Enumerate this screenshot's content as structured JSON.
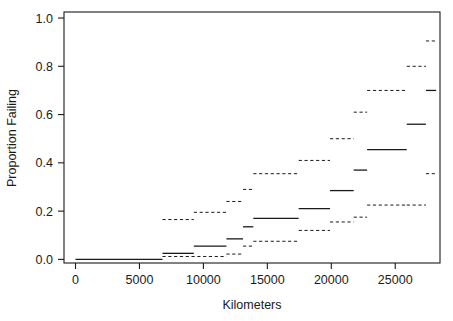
{
  "chart_data": {
    "type": "line",
    "title": "",
    "subtitle": "",
    "xlabel": "Kilometers",
    "ylabel": "Proportion Failing",
    "xlim": [
      -900,
      28500
    ],
    "ylim": [
      -0.015,
      1.025
    ],
    "xticks": [
      0,
      5000,
      10000,
      15000,
      20000,
      25000
    ],
    "xticklabels": [
      "0",
      "5000",
      "10000",
      "15000",
      "20000",
      "25000"
    ],
    "yticks": [
      0.0,
      0.2,
      0.4,
      0.6,
      0.8,
      1.0
    ],
    "yticklabels": [
      "0.0",
      "0.2",
      "0.4",
      "0.6",
      "0.8",
      "1.0"
    ],
    "grid": false,
    "legend": null,
    "line_color": "#1a1a1a",
    "axis_color": "#1a1a1a",
    "series": [
      {
        "name": "estimate",
        "style": "solid",
        "description": "Kaplan-Meier style step estimate of cumulative proportion failing",
        "steps": [
          {
            "x0": 0,
            "x1": 6800,
            "y": 0.0
          },
          {
            "x0": 6800,
            "x1": 9250,
            "y": 0.025
          },
          {
            "x0": 9250,
            "x1": 11800,
            "y": 0.055
          },
          {
            "x0": 11800,
            "x1": 13100,
            "y": 0.085
          },
          {
            "x0": 13100,
            "x1": 13900,
            "y": 0.135
          },
          {
            "x0": 13900,
            "x1": 17450,
            "y": 0.17
          },
          {
            "x0": 17450,
            "x1": 19900,
            "y": 0.21
          },
          {
            "x0": 19900,
            "x1": 21750,
            "y": 0.285
          },
          {
            "x0": 21750,
            "x1": 22800,
            "y": 0.37
          },
          {
            "x0": 22800,
            "x1": 25900,
            "y": 0.455
          },
          {
            "x0": 25900,
            "x1": 27400,
            "y": 0.56
          },
          {
            "x0": 27400,
            "x1": 28200,
            "y": 0.7
          }
        ]
      },
      {
        "name": "upper-confidence-band",
        "style": "dashed",
        "description": "Upper pointwise confidence limit",
        "steps": [
          {
            "x0": 6800,
            "x1": 9250,
            "y": 0.165
          },
          {
            "x0": 9250,
            "x1": 11800,
            "y": 0.195
          },
          {
            "x0": 11800,
            "x1": 13100,
            "y": 0.24
          },
          {
            "x0": 13100,
            "x1": 13900,
            "y": 0.29
          },
          {
            "x0": 13900,
            "x1": 17450,
            "y": 0.355
          },
          {
            "x0": 17450,
            "x1": 19900,
            "y": 0.41
          },
          {
            "x0": 19900,
            "x1": 21750,
            "y": 0.5
          },
          {
            "x0": 21750,
            "x1": 22800,
            "y": 0.61
          },
          {
            "x0": 22800,
            "x1": 25900,
            "y": 0.7
          },
          {
            "x0": 25900,
            "x1": 27400,
            "y": 0.8
          },
          {
            "x0": 27400,
            "x1": 28200,
            "y": 0.905
          }
        ]
      },
      {
        "name": "lower-confidence-band",
        "style": "dashed",
        "description": "Lower pointwise confidence limit",
        "steps": [
          {
            "x0": 6800,
            "x1": 11800,
            "y": 0.012
          },
          {
            "x0": 11800,
            "x1": 13100,
            "y": 0.022
          },
          {
            "x0": 13100,
            "x1": 13900,
            "y": 0.055
          },
          {
            "x0": 13900,
            "x1": 17450,
            "y": 0.075
          },
          {
            "x0": 17450,
            "x1": 19900,
            "y": 0.12
          },
          {
            "x0": 19900,
            "x1": 21750,
            "y": 0.155
          },
          {
            "x0": 21750,
            "x1": 22800,
            "y": 0.175
          },
          {
            "x0": 22800,
            "x1": 25900,
            "y": 0.225
          },
          {
            "x0": 25900,
            "x1": 27400,
            "y": 0.225
          },
          {
            "x0": 27400,
            "x1": 28200,
            "y": 0.355
          }
        ]
      }
    ]
  }
}
